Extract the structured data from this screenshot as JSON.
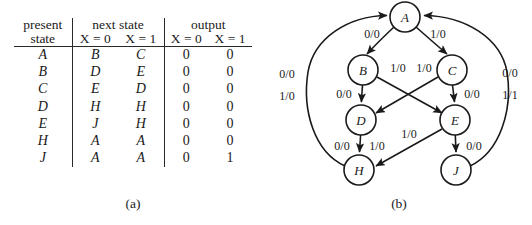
{
  "figure": {
    "caption_a": "(a)",
    "caption_b": "(b)"
  },
  "table": {
    "group_headers": {
      "present_state_line1": "present",
      "present_state_line2": "state",
      "next_state": "next state",
      "output": "output"
    },
    "sub_headers": {
      "next_x0": "X = 0",
      "next_x1": "X = 1",
      "out_x0": "X = 0",
      "out_x1": "X = 1"
    },
    "rows": [
      {
        "present": "A",
        "next0": "B",
        "next1": "C",
        "out0": "0",
        "out1": "0"
      },
      {
        "present": "B",
        "next0": "D",
        "next1": "E",
        "out0": "0",
        "out1": "0"
      },
      {
        "present": "C",
        "next0": "E",
        "next1": "D",
        "out0": "0",
        "out1": "0"
      },
      {
        "present": "D",
        "next0": "H",
        "next1": "H",
        "out0": "0",
        "out1": "0"
      },
      {
        "present": "E",
        "next0": "J",
        "next1": "H",
        "out0": "0",
        "out1": "0"
      },
      {
        "present": "H",
        "next0": "A",
        "next1": "A",
        "out0": "0",
        "out1": "0"
      },
      {
        "present": "J",
        "next0": "A",
        "next1": "A",
        "out0": "0",
        "out1": "1"
      }
    ]
  },
  "diagram": {
    "nodes": [
      {
        "id": "A",
        "label": "A",
        "cx": 139,
        "cy": 17,
        "r": 15
      },
      {
        "id": "B",
        "label": "B",
        "cx": 97,
        "cy": 70,
        "r": 15
      },
      {
        "id": "C",
        "label": "C",
        "cx": 186,
        "cy": 70,
        "r": 15
      },
      {
        "id": "D",
        "label": "D",
        "cx": 95,
        "cy": 120,
        "r": 15
      },
      {
        "id": "E",
        "label": "E",
        "cx": 189,
        "cy": 120,
        "r": 15
      },
      {
        "id": "H",
        "label": "H",
        "cx": 93,
        "cy": 170,
        "r": 15
      },
      {
        "id": "J",
        "label": "J",
        "cx": 190,
        "cy": 170,
        "r": 15
      }
    ],
    "edge_labels": [
      {
        "id": "A-B",
        "text": "0/0",
        "x": 106,
        "y": 34
      },
      {
        "id": "A-C",
        "text": "1/0",
        "x": 172,
        "y": 34
      },
      {
        "id": "B-E",
        "text": "1/0",
        "x": 132,
        "y": 68
      },
      {
        "id": "C-D",
        "text": "1/0",
        "x": 156,
        "y": 68
      },
      {
        "id": "B-D",
        "text": "0/0",
        "x": 78,
        "y": 94
      },
      {
        "id": "C-E",
        "text": "0/0",
        "x": 205,
        "y": 94
      },
      {
        "id": "D-H-0",
        "text": "0/0",
        "x": 76,
        "y": 146
      },
      {
        "id": "D-H-1",
        "text": "1/0",
        "x": 112,
        "y": 146
      },
      {
        "id": "E-H",
        "text": "1/0",
        "x": 142,
        "y": 134
      },
      {
        "id": "E-J",
        "text": "0/0",
        "x": 207,
        "y": 146
      },
      {
        "id": "H-A-0",
        "text": "0/0",
        "x": 21,
        "y": 74
      },
      {
        "id": "H-A-1",
        "text": "1/0",
        "x": 21,
        "y": 96
      },
      {
        "id": "J-A-0",
        "text": "0/0",
        "x": 243,
        "y": 73
      },
      {
        "id": "J-A-1",
        "text": "1/1",
        "x": 243,
        "y": 95
      }
    ]
  }
}
